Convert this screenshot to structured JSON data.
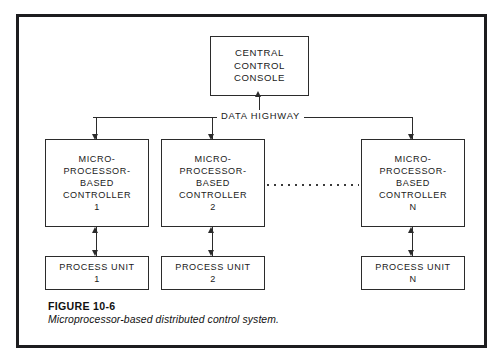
{
  "figure": {
    "caption_title": "FIGURE 10-6",
    "caption_subtitle": "Microprocessor-based distributed control system.",
    "bus_label": "DATA HIGHWAY",
    "border_color": "#1d1d1f",
    "line_color": "#2b2b2b",
    "background": "#ffffff"
  },
  "console": {
    "line1": "CENTRAL",
    "line2": "CONTROL",
    "line3": "CONSOLE"
  },
  "controllers": [
    {
      "line1": "MICRO-",
      "line2": "PROCESSOR-",
      "line3": "BASED",
      "line4": "CONTROLLER",
      "index": "1"
    },
    {
      "line1": "MICRO-",
      "line2": "PROCESSOR-",
      "line3": "BASED",
      "line4": "CONTROLLER",
      "index": "2"
    },
    {
      "line1": "MICRO-",
      "line2": "PROCESSOR-",
      "line3": "BASED",
      "line4": "CONTROLLER",
      "index": "N"
    }
  ],
  "process_units": [
    {
      "label": "PROCESS UNIT",
      "index": "1"
    },
    {
      "label": "PROCESS UNIT",
      "index": "2"
    },
    {
      "label": "PROCESS UNIT",
      "index": "N"
    }
  ]
}
